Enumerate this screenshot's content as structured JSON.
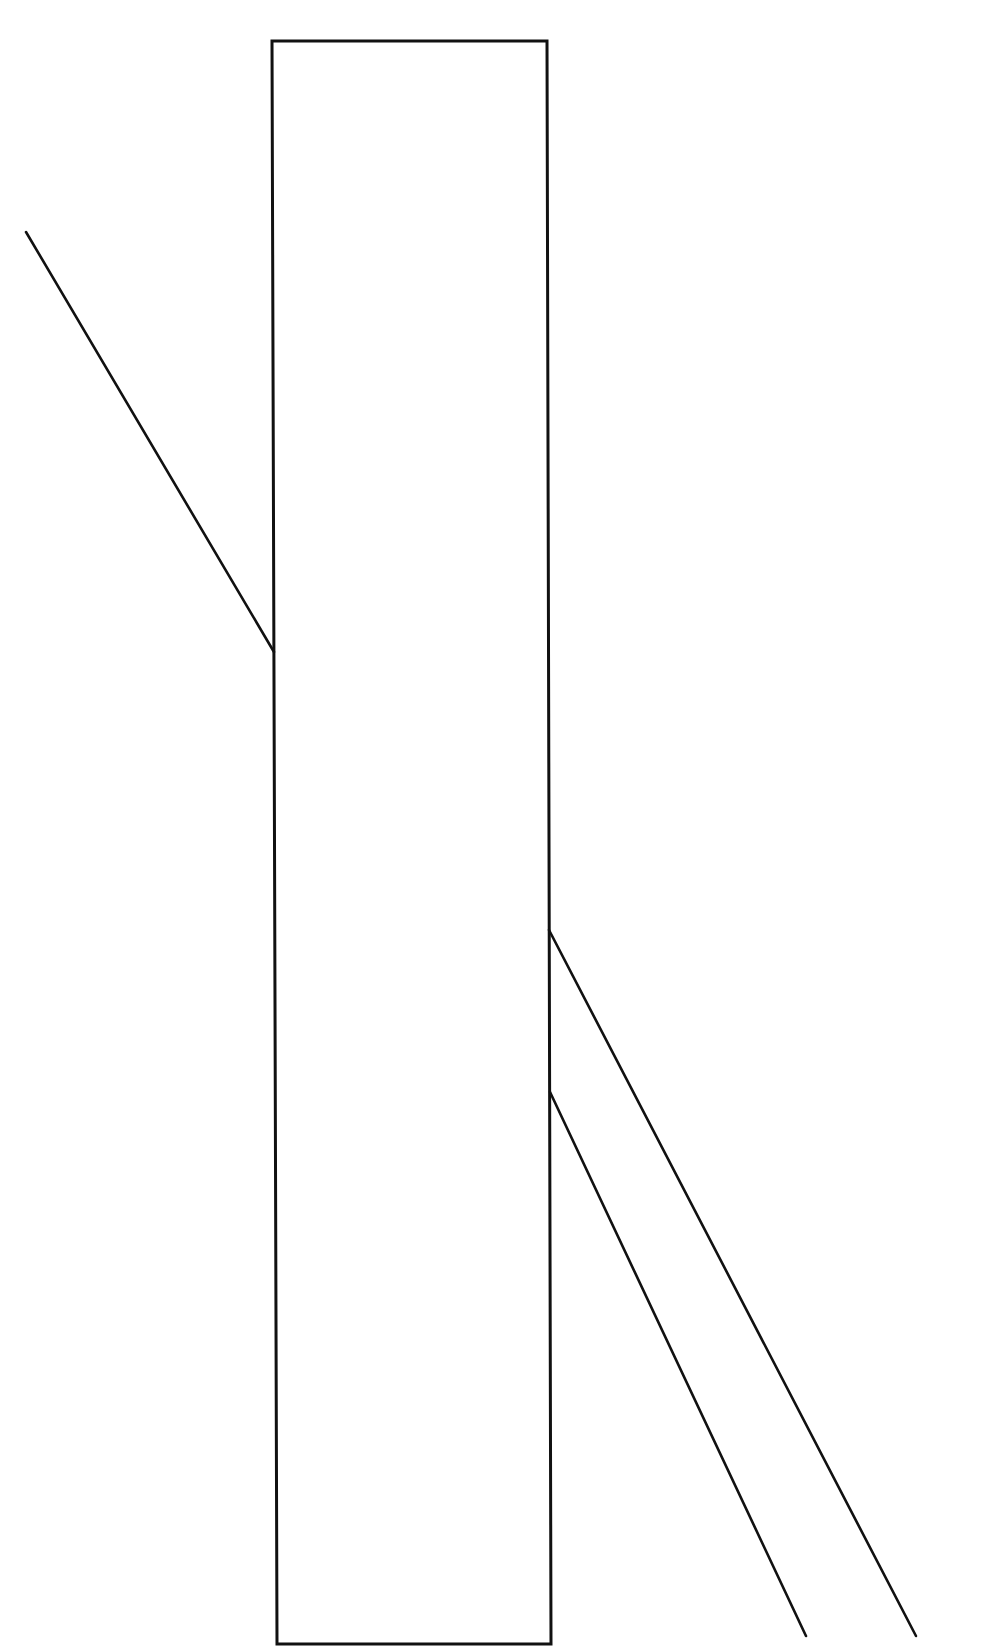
{
  "diagram": {
    "type": "poggendorff-illusion",
    "canvas": {
      "width": 1007,
      "height": 1646,
      "background": "#ffffff"
    },
    "stroke_color": "#111111",
    "occluder_rect": {
      "points": [
        [
          272,
          41
        ],
        [
          547,
          41
        ],
        [
          551,
          1644
        ],
        [
          277,
          1644
        ]
      ],
      "stroke_width": 3,
      "fill": "#ffffff"
    },
    "lines": [
      {
        "id": "left-transversal",
        "from": [
          26,
          232
        ],
        "to": [
          274,
          652
        ],
        "stroke_width": 2.6
      },
      {
        "id": "right-transversal-upper",
        "from": [
          549,
          930
        ],
        "to": [
          916,
          1636
        ],
        "stroke_width": 2.6
      },
      {
        "id": "right-transversal-lower",
        "from": [
          550,
          1092
        ],
        "to": [
          806,
          1636
        ],
        "stroke_width": 2.6
      }
    ]
  }
}
